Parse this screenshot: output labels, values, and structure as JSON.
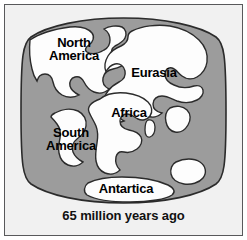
{
  "figure": {
    "caption": "65 million years ago",
    "colors": {
      "ocean": "#9c9c9c",
      "land": "#fdfdfd",
      "outline": "#2b2b2b",
      "background": "#f1f1f1",
      "frame": "#58595b",
      "text": "#000000"
    }
  },
  "map": {
    "projection": "flattened-oval",
    "labels": [
      {
        "id": "north-america",
        "text": "North\nAmerica"
      },
      {
        "id": "eurasia",
        "text": "Eurasia"
      },
      {
        "id": "africa",
        "text": "Africa"
      },
      {
        "id": "south-america",
        "text": "South\nAmerica"
      },
      {
        "id": "antarctica",
        "text": "Antartica"
      }
    ],
    "unlabeled_landmasses": [
      "india",
      "madagascar",
      "australia",
      "greenland"
    ]
  }
}
